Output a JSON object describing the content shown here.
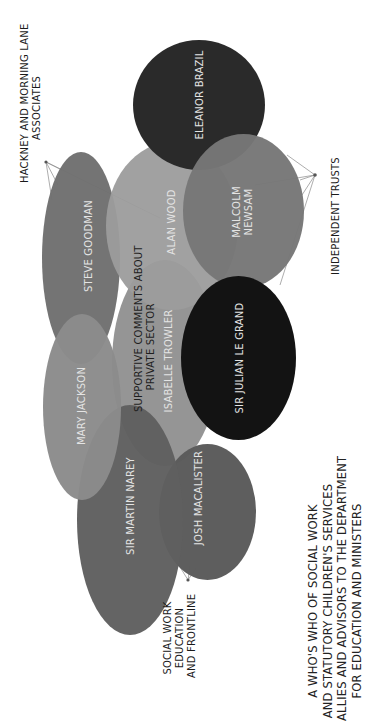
{
  "diagram": {
    "orientation": "rotated-90-ccw",
    "title_lines": [
      "A WHO'S WHO OF SOCIAL WORK",
      "AND STATUTORY CHILDREN'S SERVICES",
      "ALLIES AND ADVISORS TO THE DEPARTMENT",
      "FOR EDUCATION AND MINISTERS"
    ],
    "people": [
      {
        "id": "eleanor-brazil",
        "name": "ELEANOR BRAZIL",
        "color": "#2a2a2a"
      },
      {
        "id": "malcolm-newsam",
        "name_lines": [
          "MALCOLM",
          "NEWSAM"
        ],
        "color": "#777777"
      },
      {
        "id": "alan-wood",
        "name": "ALAN WOOD",
        "color": "#9c9c9c"
      },
      {
        "id": "steve-goodman",
        "name": "STEVE GOODMAN",
        "color": "#6f6f6f"
      },
      {
        "id": "isabelle-trowler",
        "name": "ISABELLE TROWLER",
        "color": "#8f8f8f"
      },
      {
        "id": "sir-julian-le-grand",
        "name": "SIR JULIAN LE GRAND",
        "color": "#131313"
      },
      {
        "id": "mary-jackson",
        "name": "MARY JACKSON",
        "color": "#8b8b8b"
      },
      {
        "id": "sir-martin-narey",
        "name": "SIR MARTIN NAREY",
        "color": "#5f5f5f"
      },
      {
        "id": "josh-macalister",
        "name": "JOSH MACALISTER",
        "color": "#5b5b5b"
      }
    ],
    "overlay_label_lines": [
      "SUPPORTIVE COMMENTS ABOUT",
      "PRIVATE SECTOR"
    ],
    "groups": [
      {
        "id": "hackney",
        "label_lines": [
          "HACKNEY AND MORNING LANE",
          "ASSOCIATES"
        ]
      },
      {
        "id": "independent-trusts",
        "label_lines": [
          "INDEPENDENT TRUSTS"
        ]
      },
      {
        "id": "social-work-education",
        "label_lines": [
          "SOCIAL WORK",
          "EDUCATION",
          "AND FRONTLINE"
        ]
      }
    ]
  }
}
